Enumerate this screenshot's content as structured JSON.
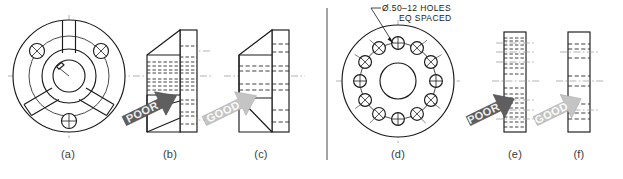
{
  "figure": {
    "background_color": "#ffffff",
    "line_color": "#1a1a1a",
    "centerline_color": "#9a9a9a",
    "divider_color": "#bdbdbd"
  },
  "annotation": {
    "line1": "Ø.50–12 HOLES",
    "line2": "EQ SPACED",
    "leader_name": "leader-line"
  },
  "arrows": {
    "poor": {
      "label": "POOR",
      "fill": "#5f5f5f",
      "text_color": "#efefef"
    },
    "good": {
      "label": "GOOD",
      "fill": "#c4c4c4",
      "text_color": "#f7f7f7"
    }
  },
  "captions": [
    {
      "id": "a",
      "label": "(a)",
      "left": 48,
      "desc": "ribbed-flange-front-view"
    },
    {
      "id": "b",
      "label": "(b)",
      "left": 150,
      "desc": "ribbed-flange-poor-section"
    },
    {
      "id": "c",
      "label": "(c)",
      "left": 241,
      "desc": "ribbed-flange-good-section"
    },
    {
      "id": "d",
      "label": "(d)",
      "left": 369,
      "desc": "bolt-circle-flange-front-view"
    },
    {
      "id": "e",
      "label": "(e)",
      "left": 501,
      "desc": "bolt-circle-flange-poor-section"
    },
    {
      "id": "f",
      "label": "(f)",
      "left": 565,
      "desc": "bolt-circle-flange-good-section"
    }
  ],
  "views": {
    "a": {
      "name": "ribbed-flange-front-view",
      "holes": 3,
      "ribs": 3,
      "has_keyway": true
    },
    "b": {
      "name": "ribbed-flange-poor-section",
      "hidden_line_density": "high"
    },
    "c": {
      "name": "ribbed-flange-good-section",
      "hidden_line_density": "low"
    },
    "d": {
      "name": "bolt-circle-flange-front-view",
      "holes": 12,
      "has_center_bore": true
    },
    "e": {
      "name": "bolt-circle-flange-poor-section",
      "hidden_line_density": "high"
    },
    "f": {
      "name": "bolt-circle-flange-good-section",
      "hidden_line_density": "low"
    }
  }
}
